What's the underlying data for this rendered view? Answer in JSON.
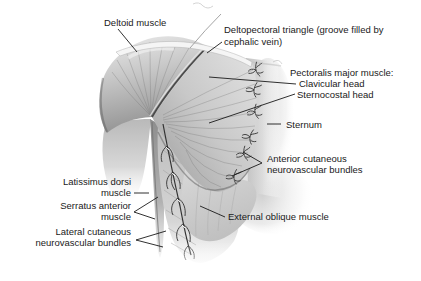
{
  "figure": {
    "type": "anatomical-diagram",
    "labels": {
      "deltoid": "Deltoid muscle",
      "deltopectoral_line1": "Deltopectoral triangle (groove filled by",
      "deltopectoral_line2": "cephalic vein)",
      "pectoralis_header": "Pectoralis major muscle:",
      "clavicular_head": "Clavicular head",
      "sternocostal_head": "Sternocostal head",
      "sternum": "Sternum",
      "anterior_line1": "Anterior cutaneous",
      "anterior_line2": "neurovascular bundles",
      "external_oblique": "External oblique muscle",
      "latissimus_line1": "Latissimus dorsi",
      "latissimus_line2": "muscle",
      "serratus_line1": "Serratus anterior",
      "serratus_line2": "muscle",
      "lateral_line1": "Lateral cutaneous",
      "lateral_line2": "neurovascular bundles"
    },
    "colors": {
      "background": "#ffffff",
      "text": "#1a1a1a",
      "leader_line": "#1a1a1a",
      "muscle_light": "#e8e8e8",
      "muscle_mid": "#bdbdbd",
      "muscle_dark": "#8f8f8f",
      "groove": "#4a4a4a",
      "bundle": "#333333"
    }
  }
}
